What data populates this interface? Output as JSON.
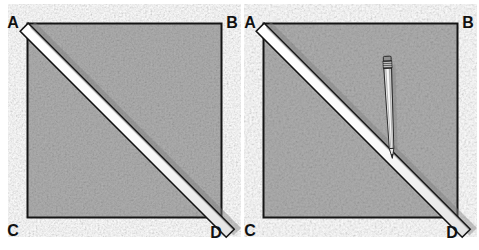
{
  "figure": {
    "background_color": "#ffffff",
    "width": 479,
    "height": 250,
    "ink_color": "#1a1a1a",
    "square_fill_color": "#b0b0b0",
    "square_fill_color_dark": "#9a9a9a",
    "ruler_face_color": "#fdfdfd",
    "ruler_edge_color": "#1a1a1a",
    "ruler_shadow_color": "#d8d8d8",
    "pencil_body_color": "#f2f2f2",
    "pencil_lead_color": "#2a2a2a",
    "pencil_ferrule_color": "#4a4a4a",
    "pencil_eraser_color": "#8a8a8a"
  },
  "panels": [
    {
      "id": "panel-left",
      "caption": "",
      "square": {
        "x": 27,
        "y": 23,
        "width": 195,
        "height": 195,
        "vertices": [
          {
            "key": "A",
            "label": "A",
            "corner": "top-left"
          },
          {
            "key": "B",
            "label": "B",
            "corner": "top-right"
          },
          {
            "key": "C",
            "label": "C",
            "corner": "bottom-left"
          },
          {
            "key": "D",
            "label": "D",
            "corner": "bottom-right"
          }
        ]
      },
      "ruler": {
        "name": "straightedge",
        "from": "A",
        "to": "D",
        "overhang_px": 18,
        "thickness_px": 12
      },
      "pencil": null
    },
    {
      "id": "panel-right",
      "caption": "",
      "square": {
        "x": 263,
        "y": 23,
        "width": 195,
        "height": 195,
        "vertices": [
          {
            "key": "A",
            "label": "A",
            "corner": "top-left"
          },
          {
            "key": "B",
            "label": "B",
            "corner": "top-right"
          },
          {
            "key": "C",
            "label": "C",
            "corner": "bottom-left"
          },
          {
            "key": "D",
            "label": "D",
            "corner": "bottom-right"
          }
        ]
      },
      "ruler": {
        "name": "straightedge",
        "from": "A",
        "to": "D",
        "overhang_px": 18,
        "thickness_px": 12
      },
      "pencil": {
        "name": "pencil",
        "tip_x": 390,
        "tip_y": 156,
        "top_x": 388,
        "top_y": 60,
        "length_px": 96,
        "tilt_degrees": 3
      }
    }
  ],
  "labels": {
    "A": "A",
    "B": "B",
    "C": "C",
    "D": "D"
  }
}
